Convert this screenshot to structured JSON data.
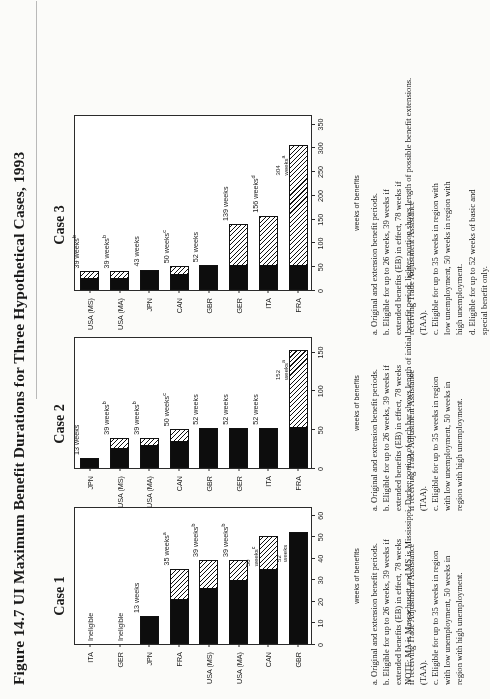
{
  "figure": {
    "title": "Figure 14.7  UI Maximum Benefit Durations for Three Hypothetical Cases, 1993",
    "note": "NOTE: MA is Massachusett and MS is Mississippi. Darker portion of each bar shows length of initial benefit period; lighter portion shows length of possible benefit extensions."
  },
  "footnotes": {
    "case1": [
      "a. Original and extension benefit periods.",
      "b. Eligible for up to 26 weeks, 39 weeks if extended benefits (EB) in effect, 78 weeks if receiving Trade Adjustment Assistance (TAA).",
      "c. Eligible for up to 35 weeks in region with low unemployment, 50 weeks in region with high unemployment."
    ],
    "case2": [
      "a. Original and extension benefit periods.",
      "b. Eligible for up to 26 weeks, 39 weeks if extended benefits (EB) in effect, 78 weeks if receiving Trade Adjustment Assistance (TAA).",
      "c. Eligible for up to 35 weeks in region with low unemployment, 50 weeks in region with high unemployment."
    ],
    "case3": [
      "a. Original and extension benefit periods.",
      "b. Eligible for up to 26 weeks, 39 weeks if extended benefits (EB) in effect, 78 weeks if receiving Trade Adjustment Assistance (TAA).",
      "c. Eligible for up to 35 weeks in region with low unemployment, 50 weeks in region with high unemployment.",
      "d. Eligible for up to 52 weeks of basic and special benefit only."
    ]
  },
  "chart_data": [
    {
      "type": "bar",
      "title": "Case 1",
      "orientation": "horizontal",
      "xlabel": "weeks of benefits",
      "ylabel": "",
      "xlim": [
        0,
        64
      ],
      "xticks": [
        0,
        10,
        20,
        30,
        40,
        50,
        60
      ],
      "xticklabels": [
        "0",
        "10",
        "20",
        "30",
        "40",
        "50",
        "60"
      ],
      "grid": false,
      "categories": [
        "ITA",
        "GER",
        "JPN",
        "FRA",
        "USA (MS)",
        "USA (MA)",
        "CAN",
        "GBR"
      ],
      "series": [
        {
          "name": "initial benefit period",
          "values": [
            0,
            0,
            13,
            21,
            26,
            30,
            35,
            52
          ]
        },
        {
          "name": "benefit extensions",
          "values": [
            0,
            0,
            0,
            14,
            13,
            9,
            15,
            0
          ]
        }
      ],
      "totals": [
        0,
        0,
        13,
        35,
        39,
        39,
        50,
        52
      ],
      "data_labels": [
        {
          "text": "Ineligible",
          "sup": ""
        },
        {
          "text": "Ineligible",
          "sup": ""
        },
        {
          "text": "13 weeks",
          "sup": ""
        },
        {
          "text": "35 weeks",
          "sup": "a"
        },
        {
          "text": "39 weeks",
          "sup": "b"
        },
        {
          "text": "39 weeks",
          "sup": "b"
        },
        {
          "text": "50 weeks",
          "sup": "c"
        },
        {
          "text": "52 weeks",
          "sup": ""
        }
      ]
    },
    {
      "type": "bar",
      "title": "Case 2",
      "orientation": "horizontal",
      "xlabel": "weeks of benefits",
      "xlim": [
        0,
        170
      ],
      "xticks": [
        0,
        50,
        100,
        150
      ],
      "xticklabels": [
        "0",
        "50",
        "100",
        "150"
      ],
      "grid": false,
      "categories": [
        "JPN",
        "USA (MS)",
        "USA (MA)",
        "CAN",
        "GBR",
        "GER",
        "ITA",
        "FRA"
      ],
      "series": [
        {
          "name": "initial benefit period",
          "values": [
            13,
            26,
            30,
            35,
            52,
            52,
            52,
            52
          ]
        },
        {
          "name": "benefit extensions",
          "values": [
            0,
            13,
            9,
            15,
            0,
            0,
            0,
            100
          ]
        }
      ],
      "totals": [
        13,
        39,
        39,
        50,
        52,
        52,
        52,
        152
      ],
      "data_labels": [
        {
          "text": "13 weeks",
          "sup": ""
        },
        {
          "text": "39 weeks",
          "sup": "b"
        },
        {
          "text": "39 weeks",
          "sup": "b"
        },
        {
          "text": "50 weeks",
          "sup": "c"
        },
        {
          "text": "52 weeks",
          "sup": ""
        },
        {
          "text": "52 weeks",
          "sup": ""
        },
        {
          "text": "52 weeks",
          "sup": ""
        },
        {
          "text": "152 weeks",
          "sup": "a"
        }
      ]
    },
    {
      "type": "bar",
      "title": "Case 3",
      "orientation": "horizontal",
      "xlabel": "weeks of benefits",
      "xlim": [
        0,
        370
      ],
      "xticks": [
        0,
        50,
        100,
        150,
        200,
        250,
        300,
        350
      ],
      "xticklabels": [
        "0",
        "50",
        "100",
        "150",
        "200",
        "250",
        "300",
        "350"
      ],
      "grid": false,
      "categories": [
        "USA (MS)",
        "USA (MA)",
        "JPN",
        "CAN",
        "GBR",
        "GER",
        "ITA",
        "FRA"
      ],
      "series": [
        {
          "name": "initial benefit period",
          "values": [
            26,
            26,
            43,
            35,
            52,
            52,
            52,
            52
          ]
        },
        {
          "name": "benefit extensions",
          "values": [
            13,
            13,
            0,
            15,
            0,
            87,
            104,
            252
          ]
        }
      ],
      "totals": [
        39,
        39,
        43,
        50,
        52,
        139,
        156,
        304
      ],
      "data_labels": [
        {
          "text": "39 weeks",
          "sup": "b"
        },
        {
          "text": "39 weeks",
          "sup": "b"
        },
        {
          "text": "43 weeks",
          "sup": ""
        },
        {
          "text": "50 weeks",
          "sup": "c"
        },
        {
          "text": "52 weeks",
          "sup": ""
        },
        {
          "text": "139 weeks",
          "sup": ""
        },
        {
          "text": "156 weeks",
          "sup": "d"
        },
        {
          "text": "304 weeks",
          "sup": "a"
        }
      ]
    }
  ]
}
